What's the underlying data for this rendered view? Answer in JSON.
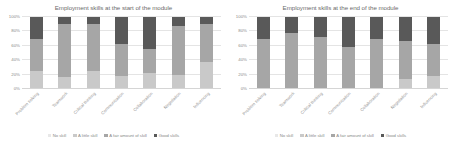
{
  "chart_data": [
    {
      "type": "bar",
      "subtype": "stacked-percent",
      "title": "Employment skills at the start of the module",
      "xlabel": "",
      "ylabel": "",
      "ylim": [
        0,
        100
      ],
      "yticks": [
        "0%",
        "20%",
        "40%",
        "60%",
        "80%",
        "100%"
      ],
      "grid": true,
      "legend_position": "bottom",
      "categories": [
        "Problem solving",
        "Teamwork",
        "Critical thinking",
        "Communication",
        "Collaboration",
        "Negotiation",
        "Influencing"
      ],
      "series": [
        {
          "name": "No skill",
          "color": "#e8e8e8",
          "values": [
            0,
            0,
            0,
            0,
            0,
            0,
            0
          ]
        },
        {
          "name": "A little skill",
          "color": "#c9c9c9",
          "values": [
            25,
            17,
            25,
            18,
            22,
            20,
            38
          ]
        },
        {
          "name": "A fair amount of skill",
          "color": "#a6a6a6",
          "values": [
            45,
            74,
            65,
            44,
            34,
            68,
            52
          ]
        },
        {
          "name": "Good skills",
          "color": "#595959",
          "values": [
            30,
            9,
            10,
            38,
            44,
            12,
            10
          ]
        }
      ]
    },
    {
      "type": "bar",
      "subtype": "stacked-percent",
      "title": "Employment skills at the end of the module",
      "xlabel": "",
      "ylabel": "",
      "ylim": [
        0,
        100
      ],
      "yticks": [
        "0%",
        "20%",
        "40%",
        "60%",
        "80%",
        "100%"
      ],
      "grid": true,
      "legend_position": "bottom",
      "categories": [
        "Problem solving",
        "Teamwork",
        "Critical thinking",
        "Communication",
        "Collaboration",
        "Negotiation",
        "Influencing"
      ],
      "series": [
        {
          "name": "No skill",
          "color": "#e8e8e8",
          "values": [
            0,
            0,
            0,
            0,
            0,
            0,
            0
          ]
        },
        {
          "name": "A little skill",
          "color": "#c9c9c9",
          "values": [
            0,
            0,
            0,
            0,
            0,
            14,
            18
          ]
        },
        {
          "name": "A fair amount of skill",
          "color": "#a6a6a6",
          "values": [
            70,
            78,
            72,
            58,
            70,
            52,
            44
          ]
        },
        {
          "name": "Good skills",
          "color": "#595959",
          "values": [
            30,
            22,
            28,
            42,
            30,
            34,
            38
          ]
        }
      ]
    }
  ]
}
